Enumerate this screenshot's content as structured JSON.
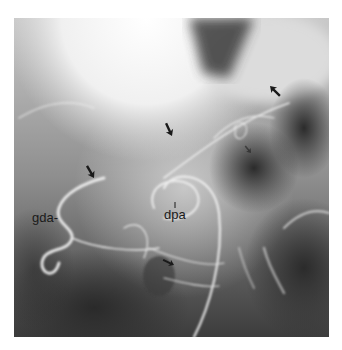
{
  "figure": {
    "labels": [
      {
        "id": "gda",
        "text": "gda-"
      },
      {
        "id": "dpa",
        "text": "dpa"
      }
    ],
    "arrows": [
      {
        "id": "arrow-1",
        "direction": "down-left"
      },
      {
        "id": "arrow-2",
        "direction": "down-right"
      },
      {
        "id": "arrow-3",
        "direction": "down-right"
      },
      {
        "id": "arrow-4",
        "direction": "right-down"
      },
      {
        "id": "arrow-5",
        "direction": "down-right"
      }
    ],
    "colors": {
      "arrow": "#1a1a1a",
      "label": "#1a1a1a",
      "background_light": "#f4f4f4",
      "background_dark": "#2a2a2a"
    }
  }
}
